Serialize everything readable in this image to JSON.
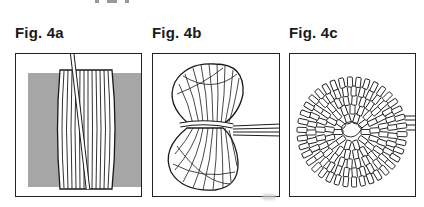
{
  "figures": [
    {
      "label": "Fig. 4a",
      "description": "yarn wrapped around gray cardboard strip"
    },
    {
      "label": "Fig. 4b",
      "description": "wrapped yarn tied tightly at the middle"
    },
    {
      "label": "Fig. 4c",
      "description": "loops cut and fluffed into round pompom"
    }
  ],
  "colors": {
    "ink": "#1a1a1a",
    "cardboard": "#a6a6a6",
    "background": "#ffffff"
  }
}
